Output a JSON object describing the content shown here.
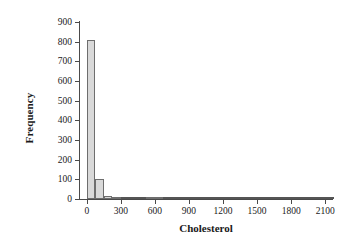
{
  "chart_data": {
    "type": "bar",
    "title": "",
    "subtitle": "",
    "xlabel": "Cholesterol",
    "ylabel": "Frequency",
    "xlim": [
      -60,
      2160
    ],
    "ylim": [
      0,
      900
    ],
    "grid": false,
    "legend": null,
    "bin_width": 75,
    "xticks": [
      0,
      300,
      600,
      900,
      1200,
      1500,
      1800,
      2100
    ],
    "xtick_labels": [
      "0",
      "300",
      "600",
      "900",
      "1200",
      "1500",
      "1800",
      "2100"
    ],
    "yticks": [
      0,
      100,
      200,
      300,
      400,
      500,
      600,
      700,
      800,
      900
    ],
    "ytick_labels": [
      "0",
      "100",
      "200",
      "300",
      "400",
      "500",
      "600",
      "700",
      "800",
      "900"
    ],
    "bins": [
      {
        "start": 0,
        "end": 75,
        "value": 810
      },
      {
        "start": 75,
        "end": 150,
        "value": 100
      },
      {
        "start": 150,
        "end": 225,
        "value": 17
      },
      {
        "start": 225,
        "end": 300,
        "value": 5
      },
      {
        "start": 300,
        "end": 375,
        "value": 2
      },
      {
        "start": 375,
        "end": 450,
        "value": 1
      },
      {
        "start": 450,
        "end": 525,
        "value": 1
      },
      {
        "start": 525,
        "end": 600,
        "value": 5
      },
      {
        "start": 600,
        "end": 675,
        "value": 5
      },
      {
        "start": 675,
        "end": 750,
        "value": 1
      },
      {
        "start": 750,
        "end": 825,
        "value": 0
      },
      {
        "start": 825,
        "end": 900,
        "value": 1
      },
      {
        "start": 900,
        "end": 975,
        "value": 1
      },
      {
        "start": 975,
        "end": 1050,
        "value": 1
      },
      {
        "start": 1050,
        "end": 1125,
        "value": 1
      },
      {
        "start": 1125,
        "end": 1200,
        "value": 1
      },
      {
        "start": 1200,
        "end": 1275,
        "value": 0
      },
      {
        "start": 1275,
        "end": 1350,
        "value": 0
      },
      {
        "start": 1350,
        "end": 1425,
        "value": 0
      },
      {
        "start": 1425,
        "end": 1500,
        "value": 0
      },
      {
        "start": 1500,
        "end": 1575,
        "value": 0
      },
      {
        "start": 1575,
        "end": 1650,
        "value": 0
      },
      {
        "start": 1650,
        "end": 1725,
        "value": 0
      },
      {
        "start": 1725,
        "end": 1800,
        "value": 0
      },
      {
        "start": 1800,
        "end": 1875,
        "value": 0
      },
      {
        "start": 1875,
        "end": 1950,
        "value": 0
      },
      {
        "start": 1950,
        "end": 2025,
        "value": 0
      },
      {
        "start": 2025,
        "end": 2100,
        "value": 2
      },
      {
        "start": 2100,
        "end": 2175,
        "value": 0
      }
    ]
  }
}
